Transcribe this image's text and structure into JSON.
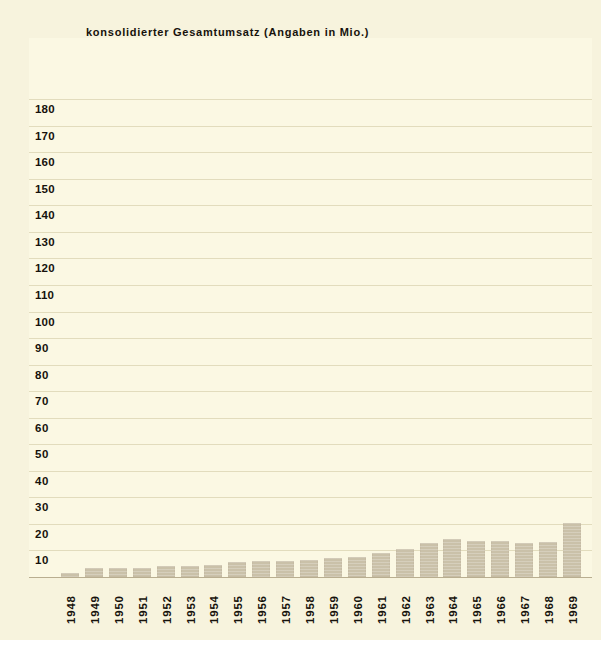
{
  "chart_data": {
    "type": "bar",
    "title": "konsolidierter Gesamtumsatz (Angaben in Mio.)",
    "xlabel": "",
    "ylabel": "",
    "ylim": [
      0,
      180
    ],
    "ytick_step": 10,
    "grid": true,
    "legend": "none",
    "categories": [
      "1948",
      "1949",
      "1950",
      "1951",
      "1952",
      "1953",
      "1954",
      "1955",
      "1956",
      "1957",
      "1958",
      "1959",
      "1960",
      "1961",
      "1962",
      "1963",
      "1964",
      "1965",
      "1966",
      "1967",
      "1968",
      "1969"
    ],
    "values": [
      1.5,
      3.3,
      3.3,
      3.5,
      4.3,
      4.3,
      4.6,
      5.7,
      6.0,
      6.2,
      6.4,
      7.0,
      7.7,
      9.0,
      10.5,
      12.8,
      14.2,
      13.6,
      13.4,
      12.8,
      13.2,
      20.4
    ],
    "yticks": [
      "180",
      "170",
      "160",
      "150",
      "140",
      "130",
      "120",
      "110",
      "100",
      "90",
      "80",
      "70",
      "60",
      "50",
      "40",
      "30",
      "20",
      "10",
      "0"
    ],
    "colors": {
      "bar": "#cac1a9",
      "plot_background": "#fbf8e3",
      "page_background": "#f7f3dd",
      "gridline": "#e2dcbd",
      "baseline": "#b9ae90",
      "text": "#16120c"
    }
  }
}
